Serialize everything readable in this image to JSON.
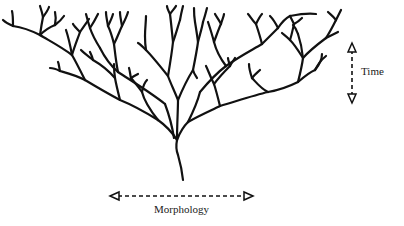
{
  "diagram": {
    "type": "branching-tree",
    "axes": {
      "time": {
        "label": "Time",
        "direction": "vertical",
        "arrow": "double-headed-dashed"
      },
      "morphology": {
        "label": "Morphology",
        "direction": "horizontal",
        "arrow": "double-headed-dashed"
      }
    },
    "colors": {
      "ink": "#111111",
      "background": "#ffffff"
    }
  }
}
